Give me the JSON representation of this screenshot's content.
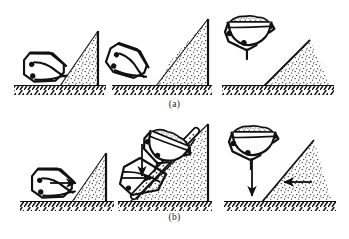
{
  "figure": {
    "ink_color": "#111111",
    "stipple_color": "#2a2a2a",
    "background": "#ffffff"
  },
  "captions": {
    "row_a": "(a)",
    "row_b": "(b)"
  },
  "rows": [
    {
      "id": "row-a",
      "label": "(a)",
      "panels": [
        {
          "id": "a1",
          "stage": 1,
          "bucket_state": "open",
          "bucket_pose": "horizontal-approach",
          "has_arrow": false,
          "arrow_direction": "",
          "soil_pile": "right-of-bucket",
          "ground": true
        },
        {
          "id": "a2",
          "stage": 2,
          "bucket_state": "closing",
          "bucket_pose": "tilted-cutting",
          "has_arrow": false,
          "arrow_direction": "",
          "soil_pile": "right-of-bucket",
          "ground": true
        },
        {
          "id": "a3",
          "stage": 3,
          "bucket_state": "closed-loaded",
          "bucket_pose": "lifted-suspended",
          "has_arrow": false,
          "arrow_direction": "",
          "soil_pile": "right-of-bucket",
          "ground": true
        }
      ]
    },
    {
      "id": "row-b",
      "label": "(b)",
      "panels": [
        {
          "id": "b1",
          "stage": 1,
          "bucket_state": "open",
          "bucket_pose": "horizontal-approach",
          "has_arrow": true,
          "arrow_direction": "right",
          "soil_pile": "right-of-bucket",
          "ground": true
        },
        {
          "id": "b2",
          "stage": 2,
          "bucket_state": "dragging",
          "bucket_pose": "tilted-on-slope-with-drag-chain",
          "has_arrow": true,
          "arrow_direction": "down-and-right",
          "soil_pile": "right-of-bucket",
          "ground": true
        },
        {
          "id": "b3",
          "stage": 3,
          "bucket_state": "closed-loaded",
          "bucket_pose": "lifted-suspended",
          "has_arrow": true,
          "arrow_direction": "down",
          "soil_pile": "right-of-bucket",
          "ground": true
        }
      ]
    }
  ]
}
